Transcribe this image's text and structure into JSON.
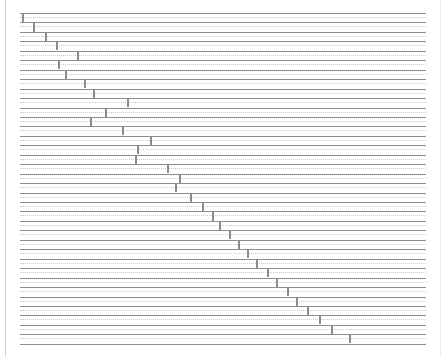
{
  "chart": {
    "title": "",
    "subtitle": "",
    "type_label": "gantt-diagonal"
  },
  "chart_data": {
    "type": "bar",
    "title": "",
    "xlabel": "",
    "ylabel": "",
    "grid": true,
    "legend": null,
    "orientation": "horizontal",
    "xlim": [
      0,
      35
    ],
    "ylim": [
      0,
      35
    ],
    "axis_ticks_visible": false,
    "tick_labels_visible": false,
    "categories": [
      "Task 1",
      "Task 2",
      "Task 3",
      "Task 4",
      "Task 5",
      "Task 6",
      "Task 7",
      "Task 8",
      "Task 9",
      "Task 10",
      "Task 11",
      "Task 12",
      "Task 13",
      "Task 14",
      "Task 15",
      "Task 16",
      "Task 17",
      "Task 18",
      "Task 19",
      "Task 20",
      "Task 21",
      "Task 22",
      "Task 23",
      "Task 24",
      "Task 25",
      "Task 26",
      "Task 27",
      "Task 28",
      "Task 29",
      "Task 30",
      "Task 31",
      "Task 32",
      "Task 33",
      "Task 34",
      "Task 35"
    ],
    "values": [
      0.3,
      1.3,
      2.4,
      3.4,
      5.4,
      3.6,
      4.3,
      6.1,
      6.9,
      10.1,
      8.1,
      6.6,
      9.7,
      12.3,
      11.1,
      10.9,
      13.9,
      15.1,
      14.7,
      16.1,
      17.3,
      18.2,
      18.9,
      19.8,
      20.7,
      21.6,
      22.5,
      23.5,
      24.4,
      25.4,
      26.3,
      27.3,
      28.4,
      29.6,
      31.3
    ],
    "marker_x_px": [
      2,
      13,
      25,
      36,
      57,
      38,
      45,
      64,
      73,
      107,
      85,
      70,
      102,
      130,
      117,
      115,
      147,
      159,
      155,
      170,
      182,
      192,
      199,
      209,
      218,
      227,
      236,
      247,
      256,
      267,
      276,
      287,
      299,
      311,
      329
    ],
    "row_count": 35
  },
  "colors": {
    "background": "#ffffff",
    "gridline_solid": "#8e8e8e",
    "gridline_dotted": "#c9c9c9",
    "marker": "#8c8c8c",
    "panel_border": "#d3d3d3"
  },
  "layout": {
    "plot_left_px": 20,
    "plot_top_px": 13,
    "plot_width_px": 406,
    "plot_height_px": 333,
    "row_height_px": 9.45
  }
}
